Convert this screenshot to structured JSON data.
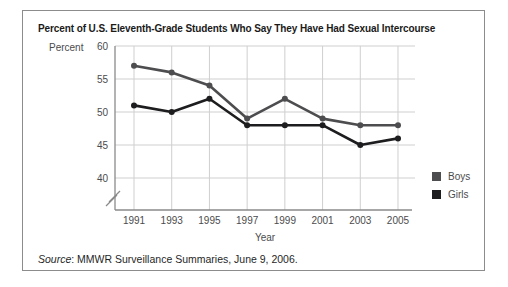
{
  "figure": {
    "title": "Percent of U.S. Eleventh-Grade Students Who Say They Have Had Sexual Intercourse"
  },
  "source": {
    "label": "Source",
    "text": ": MMWR Surveillance Summaries, June 9, 2006."
  },
  "chart_data": {
    "type": "line",
    "title": "Percent of U.S. Eleventh-Grade Students Who Say They Have Had Sexual Intercourse",
    "xlabel": "Year",
    "ylabel": "Percent",
    "x": [
      1991,
      1993,
      1995,
      1997,
      1999,
      2001,
      2003,
      2005
    ],
    "series": [
      {
        "name": "Boys",
        "color": "#4d4d4f",
        "values": [
          57,
          56,
          54,
          49,
          52,
          49,
          48,
          48
        ]
      },
      {
        "name": "Girls",
        "color": "#1d1d1f",
        "values": [
          51,
          50,
          52,
          48,
          48,
          48,
          45,
          46
        ]
      }
    ],
    "yticks": [
      60,
      55,
      50,
      45,
      40
    ],
    "ylim_display": [
      40,
      60
    ],
    "axis_break_below": 40,
    "grid": "on",
    "legend_position": "right",
    "colors": {
      "gridline": "#cfcfcf",
      "axis": "#8a8a8a",
      "tick_text": "#4b4b4d"
    }
  }
}
